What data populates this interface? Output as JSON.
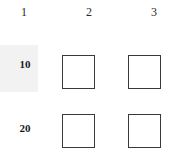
{
  "figure": {
    "type": "grid-matrix",
    "background_color": "#ffffff",
    "highlight_color": "#f2f2f2",
    "box_border_color": "#3a3a3a",
    "column_headers": [
      {
        "label": "1"
      },
      {
        "label": "2"
      },
      {
        "label": "3"
      }
    ],
    "rows": [
      {
        "label": "10",
        "highlighted": true,
        "cells": [
          {
            "column": "1",
            "content": "",
            "has_box": false
          },
          {
            "column": "2",
            "content": "",
            "has_box": true
          },
          {
            "column": "3",
            "content": "",
            "has_box": true
          }
        ]
      },
      {
        "label": "20",
        "highlighted": false,
        "cells": [
          {
            "column": "1",
            "content": "",
            "has_box": false
          },
          {
            "column": "2",
            "content": "",
            "has_box": true
          },
          {
            "column": "3",
            "content": "",
            "has_box": true
          }
        ]
      }
    ]
  }
}
